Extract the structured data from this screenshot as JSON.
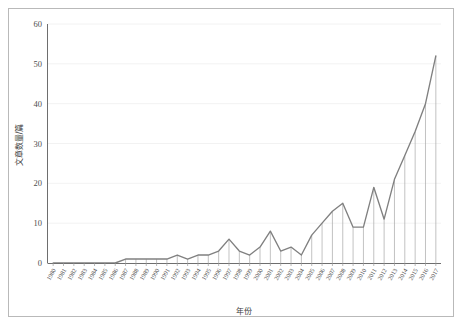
{
  "chart_data": {
    "type": "line",
    "title": "",
    "xlabel": "年份",
    "ylabel": "文章数量/篇",
    "ylim": [
      0,
      60
    ],
    "yticks": [
      0,
      10,
      20,
      30,
      40,
      50,
      60
    ],
    "ytick_labels": [
      "0",
      "10",
      "20",
      "30",
      "40",
      "50",
      "60"
    ],
    "grid": true,
    "legend": null,
    "line_color": "#808080",
    "dropline_color": "#a8a8a8",
    "gridline_color": "#efefef",
    "axis_color": "#6e6e6e",
    "categories": [
      "1980",
      "1981",
      "1982",
      "1983",
      "1984",
      "1985",
      "1986",
      "1987",
      "1988",
      "1989",
      "1990",
      "1991",
      "1992",
      "1993",
      "1994",
      "1995",
      "1996",
      "1997",
      "1998",
      "1999",
      "2000",
      "2001",
      "2002",
      "2003",
      "2004",
      "2005",
      "2006",
      "2007",
      "2008",
      "2009",
      "2010",
      "2011",
      "2012",
      "2013",
      "2014",
      "2015",
      "2016",
      "2017"
    ],
    "values": [
      0,
      0,
      0,
      0,
      0,
      0,
      0,
      1,
      1,
      1,
      1,
      1,
      2,
      1,
      2,
      2,
      3,
      6,
      3,
      2,
      4,
      8,
      3,
      4,
      2,
      7,
      10,
      13,
      15,
      9,
      9,
      19,
      11,
      21,
      27,
      33,
      40,
      52
    ]
  },
  "axes": {
    "y_axis_title": "文章数量/篇",
    "x_axis_title": "年份"
  }
}
